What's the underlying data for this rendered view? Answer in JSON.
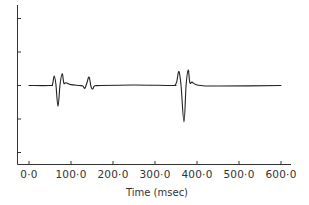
{
  "chart_data": {
    "type": "line",
    "title": "",
    "xlabel": "Time (msec)",
    "ylabel": "",
    "xlim": [
      0,
      600
    ],
    "ylim": [
      -1,
      1
    ],
    "grid": false,
    "legend": null,
    "x_ticks": [
      "0·0",
      "100·0",
      "200·0",
      "300·0",
      "400·0",
      "500·0",
      "600·0"
    ],
    "x_tick_values": [
      0,
      100,
      200,
      300,
      400,
      500,
      600
    ],
    "y_ticks_count": 5,
    "y_tick_labels": [],
    "series": [
      {
        "name": "waveform",
        "color": "#222222",
        "x": [
          0,
          50,
          56,
          60,
          64,
          69,
          74,
          79,
          83,
          88,
          100,
          120,
          128,
          133,
          138,
          143,
          148,
          152,
          156,
          170,
          250,
          340,
          348,
          352,
          357,
          362,
          369,
          374,
          379,
          383,
          388,
          395,
          410,
          450,
          600
        ],
        "y": [
          0,
          0,
          0.05,
          0.34,
          0.05,
          -0.75,
          0.05,
          0.42,
          0.08,
          0.1,
          0.03,
          0.0,
          -0.02,
          -0.1,
          0.1,
          0.3,
          -0.06,
          -0.12,
          -0.02,
          0.0,
          0.02,
          0.0,
          0.02,
          0.15,
          0.5,
          0.0,
          -1.3,
          0.0,
          0.55,
          0.1,
          0.12,
          0.05,
          0.0,
          -0.02,
          0.0
        ]
      }
    ]
  },
  "plot": {
    "xaxis_title": "Time (msec)"
  }
}
